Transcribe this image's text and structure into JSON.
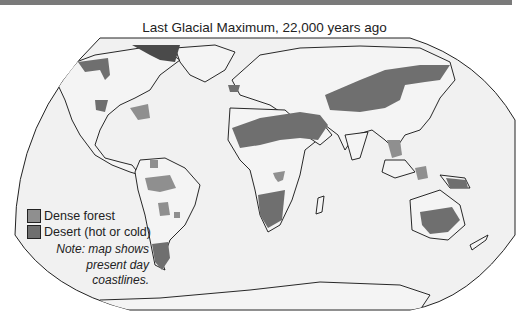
{
  "title": "Last Glacial Maximum, 22,000 years ago",
  "legend": {
    "items": [
      {
        "label": "Dense forest",
        "color": "#8f8f8f"
      },
      {
        "label": "Desert (hot or cold)",
        "color": "#6f6f6f"
      }
    ],
    "note": [
      "Note: map shows",
      "present day",
      "coastlines."
    ]
  },
  "colors": {
    "ocean": "#f1f1f1",
    "forest": "#8f8f8f",
    "desert": "#6f6f6f",
    "outline": "#111111",
    "topbar": "#7a7a7a"
  }
}
